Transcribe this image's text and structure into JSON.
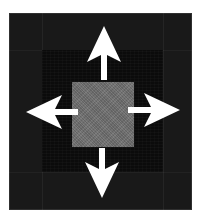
{
  "figure": {
    "canvas": {
      "width": 204,
      "height": 221
    }
  },
  "colors": {
    "page_background": "#ffffff",
    "outer_frame": "#191919",
    "inner_square": "#0b0b0b",
    "center_square": "#6e6e6e",
    "arrow": "#ffffff"
  },
  "regions": [
    {
      "name": "outer-frame",
      "label": "Outer frame band",
      "color": "#191919",
      "x": 9,
      "y": 13,
      "width": 183,
      "height": 197
    },
    {
      "name": "inner-square",
      "label": "Inner dark region",
      "color": "#0b0b0b",
      "x": 42,
      "y": 50,
      "width": 121,
      "height": 122
    },
    {
      "name": "center-square",
      "label": "Center gray square",
      "color": "#6e6e6e",
      "x": 72,
      "y": 82,
      "width": 62,
      "height": 65
    }
  ],
  "arrows": [
    {
      "name": "arrow-up",
      "label": "Up arrow",
      "direction": "up",
      "tip_x": 104,
      "tip_y": 26,
      "tail_x": 104,
      "tail_y": 78
    },
    {
      "name": "arrow-down",
      "label": "Down arrow",
      "direction": "down",
      "tip_x": 102,
      "tip_y": 198,
      "tail_x": 102,
      "tail_y": 150
    },
    {
      "name": "arrow-left",
      "label": "Left arrow",
      "direction": "left",
      "tip_x": 26,
      "tip_y": 112,
      "tail_x": 76,
      "tail_y": 112
    },
    {
      "name": "arrow-right",
      "label": "Right arrow",
      "direction": "right",
      "tip_x": 180,
      "tip_y": 110,
      "tail_x": 130,
      "tail_y": 110
    }
  ],
  "chart_data": {
    "type": "diagram",
    "shapes": [
      {
        "kind": "square",
        "role": "outer-frame",
        "fill": "#191919",
        "x": 9,
        "y": 13,
        "width": 183,
        "height": 197
      },
      {
        "kind": "square",
        "role": "inner-square",
        "fill": "#0b0b0b",
        "x": 42,
        "y": 50,
        "width": 121,
        "height": 122
      },
      {
        "kind": "square",
        "role": "center-square",
        "fill": "#6e6e6e",
        "x": 72,
        "y": 82,
        "width": 62,
        "height": 65
      }
    ],
    "annotations": [
      {
        "kind": "arrow",
        "direction": "up",
        "fill": "#ffffff"
      },
      {
        "kind": "arrow",
        "direction": "down",
        "fill": "#ffffff"
      },
      {
        "kind": "arrow",
        "direction": "left",
        "fill": "#ffffff"
      },
      {
        "kind": "arrow",
        "direction": "right",
        "fill": "#ffffff"
      }
    ]
  }
}
